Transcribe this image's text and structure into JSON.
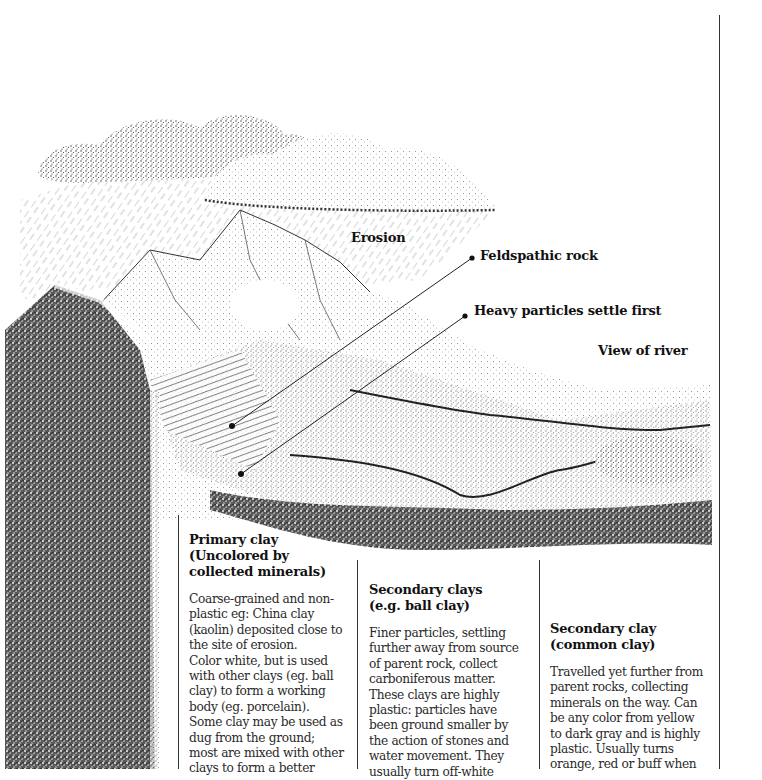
{
  "diagram": {
    "labels": {
      "erosion": "Erosion",
      "feldspathic_rock": "Feldspathic rock",
      "heavy_particles": "Heavy particles settle first",
      "view_of_river": "View of river"
    },
    "columns": [
      {
        "title_lines": [
          "Primary clay",
          "(Uncolored by",
          "collected minerals)"
        ],
        "body": "Coarse-grained and non-plastic eg: China clay (kaolin) deposited close to the site of erosion. Color white, but is used with other clays (eg. ball clay) to form a working body (eg. porcelain). Some clay may be used as dug from the ground; most are mixed with other clays to form a better",
        "body_lines": [
          "Coarse-grained and non-",
          "plastic eg:  China clay",
          "(kaolin) deposited close to",
          "the site of erosion.",
          "Color white, but is used",
          "with other clays (eg. ball",
          "clay) to form a working",
          "body (eg. porcelain).",
          "Some clay may be used as",
          "dug from the ground;",
          "most are mixed with other",
          "clays to form a better"
        ]
      },
      {
        "title_lines": [
          "Secondary clays",
          "(e.g. ball clay)"
        ],
        "body_lines": [
          "Finer particles, settling",
          "further away from source",
          "of parent rock, collect",
          "carboniferous matter.",
          "These clays are highly",
          "plastic: particles have",
          "been ground smaller by",
          "the action of stones and",
          "water movement. They",
          "usually turn off-white"
        ]
      },
      {
        "title_lines": [
          "Secondary clay",
          "(common clay)"
        ],
        "body_lines": [
          "Travelled yet further from",
          "parent rocks, collecting",
          "minerals on the way. Can",
          "be any color from yellow",
          "to dark gray and is highly",
          "plastic. Usually turns",
          "orange, red or buff when"
        ]
      }
    ],
    "colors": {
      "ink": "#111111",
      "body_text": "#2a2a2a",
      "background": "#ffffff"
    }
  }
}
